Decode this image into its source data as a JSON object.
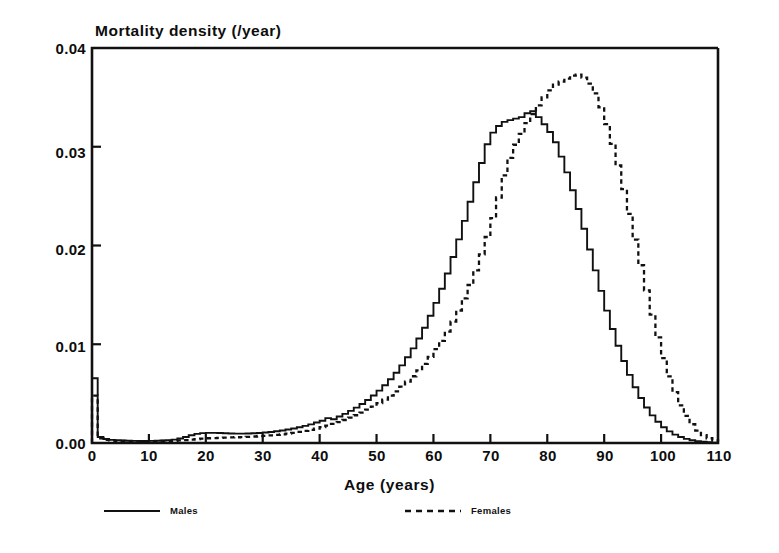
{
  "chart_data": {
    "type": "line",
    "title": "Mortality density (/year)",
    "xlabel": "Age (years)",
    "ylabel": "Mortality density (/year)",
    "xlim": [
      0,
      110
    ],
    "ylim": [
      0,
      0.04
    ],
    "grid": false,
    "legend_position": "below",
    "style": "step",
    "xticks": [
      0,
      10,
      20,
      30,
      40,
      50,
      60,
      70,
      80,
      90,
      100,
      110
    ],
    "xtick_labels": [
      "0",
      "10",
      "20",
      "30",
      "40",
      "50",
      "60",
      "70",
      "80",
      "90",
      "100",
      "110"
    ],
    "yticks": [
      0.0,
      0.01,
      0.02,
      0.03,
      0.04
    ],
    "ytick_labels": [
      "0.00",
      "0.01",
      "0.02",
      "0.03",
      "0.04"
    ],
    "x": [
      0,
      1,
      2,
      3,
      4,
      5,
      6,
      7,
      8,
      9,
      10,
      11,
      12,
      13,
      14,
      15,
      16,
      17,
      18,
      19,
      20,
      21,
      22,
      23,
      24,
      25,
      26,
      27,
      28,
      29,
      30,
      31,
      32,
      33,
      34,
      35,
      36,
      37,
      38,
      39,
      40,
      41,
      42,
      43,
      44,
      45,
      46,
      47,
      48,
      49,
      50,
      51,
      52,
      53,
      54,
      55,
      56,
      57,
      58,
      59,
      60,
      61,
      62,
      63,
      64,
      65,
      66,
      67,
      68,
      69,
      70,
      71,
      72,
      73,
      74,
      75,
      76,
      77,
      78,
      79,
      80,
      81,
      82,
      83,
      84,
      85,
      86,
      87,
      88,
      89,
      90,
      91,
      92,
      93,
      94,
      95,
      96,
      97,
      98,
      99,
      100,
      101,
      102,
      103,
      104,
      105,
      106,
      107,
      108,
      109,
      110
    ],
    "series": [
      {
        "name": "Males",
        "linestyle": "solid",
        "color": "#111111",
        "values": [
          0.00655,
          0.0006,
          0.0004,
          0.00032,
          0.00028,
          0.00025,
          0.00023,
          0.00022,
          0.00021,
          0.00021,
          0.00022,
          0.00023,
          0.00025,
          0.00028,
          0.00034,
          0.00045,
          0.0006,
          0.00078,
          0.00092,
          0.001,
          0.00103,
          0.00103,
          0.00101,
          0.00098,
          0.00096,
          0.00095,
          0.00095,
          0.00096,
          0.00098,
          0.00101,
          0.00106,
          0.00112,
          0.00119,
          0.00127,
          0.00136,
          0.00147,
          0.00159,
          0.00173,
          0.00189,
          0.00207,
          0.00226,
          0.00252,
          0.00241,
          0.00268,
          0.00295,
          0.00325,
          0.00358,
          0.00395,
          0.00436,
          0.00481,
          0.0053,
          0.00585,
          0.00645,
          0.00712,
          0.00786,
          0.00868,
          0.00958,
          0.01058,
          0.01167,
          0.01288,
          0.01419,
          0.01562,
          0.01717,
          0.01884,
          0.02062,
          0.02249,
          0.02443,
          0.0264,
          0.02836,
          0.03026,
          0.03143,
          0.0321,
          0.03252,
          0.0327,
          0.03285,
          0.033,
          0.0334,
          0.0336,
          0.033,
          0.03228,
          0.0315,
          0.03045,
          0.029,
          0.0274,
          0.0256,
          0.0237,
          0.0217,
          0.0196,
          0.01748,
          0.0154,
          0.0134,
          0.01155,
          0.00985,
          0.0083,
          0.0069,
          0.00565,
          0.00455,
          0.0036,
          0.0028,
          0.00215,
          0.0016,
          0.00118,
          0.00085,
          0.0006,
          0.00042,
          0.00028,
          0.00018,
          0.00012,
          7e-05,
          4e-05,
          2e-05
        ]
      },
      {
        "name": "Females",
        "linestyle": "dashed",
        "color": "#111111",
        "values": [
          0.0048,
          0.00048,
          0.00032,
          0.00026,
          0.00022,
          0.0002,
          0.00019,
          0.00018,
          0.00018,
          0.00018,
          0.00018,
          0.00019,
          0.0002,
          0.00021,
          0.00023,
          0.00026,
          0.0003,
          0.00035,
          0.0004,
          0.00044,
          0.00048,
          0.0005,
          0.00052,
          0.00054,
          0.00056,
          0.00058,
          0.0006,
          0.00063,
          0.00066,
          0.00069,
          0.00073,
          0.00077,
          0.00082,
          0.00088,
          0.00095,
          0.00103,
          0.00112,
          0.00122,
          0.00133,
          0.00146,
          0.0016,
          0.00176,
          0.00193,
          0.00212,
          0.00233,
          0.00256,
          0.00281,
          0.00308,
          0.00337,
          0.00369,
          0.00403,
          0.0044,
          0.0048,
          0.00523,
          0.0057,
          0.00621,
          0.00676,
          0.00736,
          0.00801,
          0.00872,
          0.0095,
          0.01035,
          0.01128,
          0.0123,
          0.01342,
          0.01465,
          0.016,
          0.01748,
          0.0191,
          0.02086,
          0.02278,
          0.02486,
          0.0271,
          0.02888,
          0.0302,
          0.0313,
          0.0324,
          0.0333,
          0.0342,
          0.035,
          0.0357,
          0.0363,
          0.0366,
          0.0369,
          0.0372,
          0.0373,
          0.037,
          0.0364,
          0.0354,
          0.034,
          0.0323,
          0.0303,
          0.0281,
          0.0257,
          0.0232,
          0.0206,
          0.018,
          0.01545,
          0.013,
          0.0107,
          0.0086,
          0.00675,
          0.00515,
          0.00382,
          0.00275,
          0.0019,
          0.00126,
          0.0008,
          0.00048,
          0.00027,
          0.00014
        ]
      }
    ]
  },
  "legend": {
    "males": {
      "label": "Males",
      "style": "solid"
    },
    "females": {
      "label": "Females",
      "style": "dashed"
    }
  }
}
